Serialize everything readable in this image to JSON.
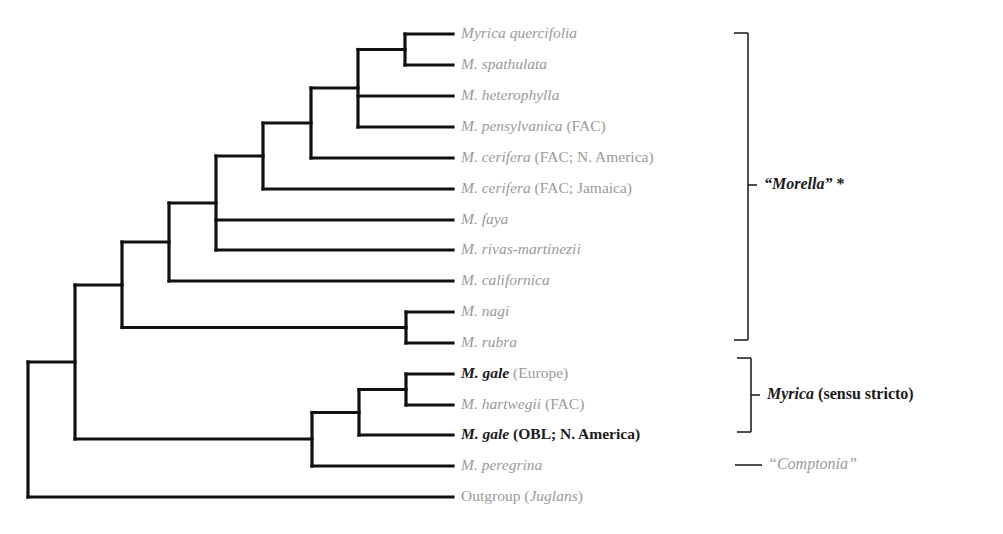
{
  "figure": {
    "type": "phylogenetic-tree",
    "line_color": "#111111",
    "text_grey": "#9a9a9a",
    "text_dark": "#1a1a1a"
  },
  "leaves": [
    {
      "id": "l1",
      "y": 34,
      "species": "Myrica quercifolia",
      "extra": "",
      "style": "grey"
    },
    {
      "id": "l2",
      "y": 65,
      "species": "M. spathulata",
      "extra": "",
      "style": "grey"
    },
    {
      "id": "l3",
      "y": 96,
      "species": "M. heterophylla",
      "extra": "",
      "style": "grey"
    },
    {
      "id": "l4",
      "y": 127,
      "species": "M. pensylvanica",
      "extra": " (FAC)",
      "style": "grey"
    },
    {
      "id": "l5",
      "y": 158,
      "species": "M. cerifera",
      "extra": " (FAC; N. America)",
      "style": "grey"
    },
    {
      "id": "l6",
      "y": 189,
      "species": "M. cerifera",
      "extra": " (FAC; Jamaica)",
      "style": "grey"
    },
    {
      "id": "l7",
      "y": 220,
      "species": "M. faya",
      "extra": "",
      "style": "grey"
    },
    {
      "id": "l8",
      "y": 250,
      "species": "M. rivas-martinezii",
      "extra": "",
      "style": "grey"
    },
    {
      "id": "l9",
      "y": 281,
      "species": "M. californica",
      "extra": "",
      "style": "grey"
    },
    {
      "id": "l10",
      "y": 312,
      "species": "M. nagi",
      "extra": "",
      "style": "grey"
    },
    {
      "id": "l11",
      "y": 343,
      "species": "M. rubra",
      "extra": "",
      "style": "grey"
    },
    {
      "id": "l12",
      "y": 374,
      "species": "M. gale",
      "extra": " (Europe)",
      "style": "bold-grey-extra"
    },
    {
      "id": "l13",
      "y": 405,
      "species": "M. hartwegii",
      "extra": " (FAC)",
      "style": "grey"
    },
    {
      "id": "l14",
      "y": 435,
      "species": "M. gale",
      "extra": " (OBL; N. America)",
      "style": "bold"
    },
    {
      "id": "l15",
      "y": 466,
      "species": "M. peregrina",
      "extra": "",
      "style": "grey"
    },
    {
      "id": "l16",
      "y": 497,
      "species": "",
      "prefix": "Outgroup (",
      "genus": "Juglans",
      "suffix": ")",
      "style": "grey"
    }
  ],
  "clades": [
    {
      "name": "Morella",
      "label_italic": "“Morella”",
      "label_rest": " *",
      "bracket": {
        "x": 748,
        "top": 33,
        "bottom": 340,
        "tick_y": 185
      }
    },
    {
      "name": "Myrica s.s.",
      "label_italic": "Myrica",
      "label_rest": " (sensu stricto)",
      "bracket": {
        "x": 751,
        "top": 358,
        "bottom": 432,
        "tick_y": 395
      }
    },
    {
      "name": "Comptonia",
      "label_italic": "“Comptonia”",
      "label_rest": "",
      "dash": {
        "x1": 735,
        "x2": 762,
        "y": 465
      }
    }
  ],
  "tree": {
    "tip_x": 453,
    "nodes": [
      {
        "id": "A",
        "x": 405,
        "y1": 34,
        "y2": 65,
        "children": [
          "l1",
          "l2"
        ]
      },
      {
        "id": "B",
        "x": 358,
        "y1": 49,
        "y2": 127,
        "children": [
          "A",
          "l3",
          "l4"
        ]
      },
      {
        "id": "C",
        "x": 311,
        "y1": 88,
        "y2": 158,
        "children": [
          "B",
          "l5"
        ]
      },
      {
        "id": "D",
        "x": 263,
        "y1": 123,
        "y2": 189,
        "children": [
          "C",
          "l6"
        ]
      },
      {
        "id": "E",
        "x": 216,
        "y1": 156,
        "y2": 250,
        "children": [
          "D",
          "l7",
          "l8"
        ]
      },
      {
        "id": "F",
        "x": 169,
        "y1": 203,
        "y2": 281,
        "children": [
          "E",
          "l9"
        ]
      },
      {
        "id": "G",
        "x": 406,
        "y1": 312,
        "y2": 343,
        "children": [
          "l10",
          "l11"
        ]
      },
      {
        "id": "H",
        "x": 122,
        "y1": 242,
        "y2": 328,
        "children": [
          "F",
          "G"
        ]
      },
      {
        "id": "I",
        "x": 406,
        "y1": 374,
        "y2": 405,
        "children": [
          "l12",
          "l13"
        ]
      },
      {
        "id": "J",
        "x": 359,
        "y1": 390,
        "y2": 435,
        "children": [
          "I",
          "l14"
        ]
      },
      {
        "id": "K",
        "x": 312,
        "y1": 412,
        "y2": 466,
        "children": [
          "J",
          "l15"
        ]
      },
      {
        "id": "L",
        "x": 75,
        "y1": 285,
        "y2": 439,
        "children": [
          "H",
          "K"
        ]
      },
      {
        "id": "Root",
        "x": 28,
        "y1": 362,
        "y2": 497,
        "children": [
          "L",
          "l16"
        ]
      }
    ]
  }
}
